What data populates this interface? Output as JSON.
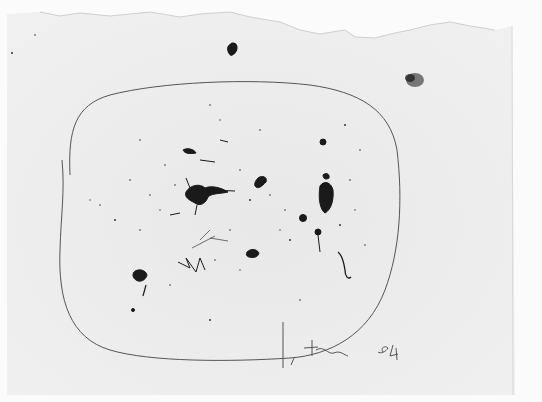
{
  "artwork": {
    "medium": "ink drawing on paper",
    "signature": "L. Fontana",
    "date_inscription": "5°4",
    "colors": {
      "paper": "#ececec",
      "paper_light": "#f4f4f4",
      "ink": "#1a1a1a",
      "line": "#555555"
    }
  }
}
